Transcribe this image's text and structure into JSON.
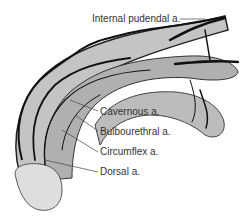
{
  "diagram": {
    "type": "anatomical illustration",
    "labels": [
      {
        "id": "internal-pudendal",
        "text": "Internal pudendal a."
      },
      {
        "id": "cavernous",
        "text": "Cavernous a."
      },
      {
        "id": "bulbourethral",
        "text": "Bulbourethral a."
      },
      {
        "id": "circumflex",
        "text": "Circumflex a."
      },
      {
        "id": "dorsal",
        "text": "Dorsal a."
      }
    ],
    "colors": {
      "tissue": "#b8b8b8",
      "tissue_light": "#d6d6d6",
      "vessel": "#1a1a1a",
      "outline": "#555555",
      "leader": "#444444",
      "background": "#ffffff"
    }
  }
}
